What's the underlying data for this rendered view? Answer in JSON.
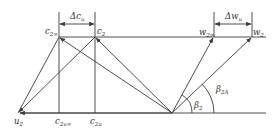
{
  "diagram": {
    "labels": {
      "delta_cu": {
        "main": "Δc",
        "sub": "u"
      },
      "delta_wu": {
        "main": "Δw",
        "sub": "u"
      },
      "c2_inf": {
        "main": "c",
        "sub": "2∞"
      },
      "c2": {
        "main": "c",
        "sub": "2"
      },
      "w2_inf": {
        "main": "w",
        "sub": "2∞"
      },
      "w2": {
        "main": "w",
        "sub": "2"
      },
      "u2": {
        "main": "u",
        "sub": "2"
      },
      "c2u_inf": {
        "main": "c",
        "sub": "2u∞"
      },
      "c2u": {
        "main": "c",
        "sub": "2u"
      },
      "beta2": {
        "main": "β",
        "sub": "2"
      },
      "beta2A": {
        "main": "β",
        "sub": "2A"
      }
    },
    "colors": {
      "line": "#3a3a3a",
      "text": "#333333",
      "background": "#ffffff"
    }
  }
}
